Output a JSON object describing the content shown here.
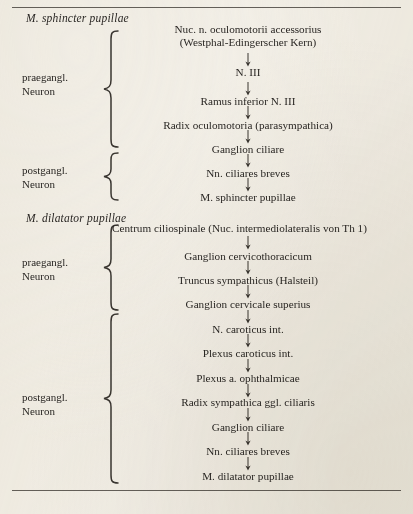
{
  "page": {
    "background_color": "#f3f0e9",
    "text_color": "#2a2724",
    "rule_color": "#4a4641"
  },
  "sections": [
    {
      "id": "sphincter",
      "title": "M. sphincter pupillae",
      "groups": [
        {
          "label_line1": "praegangl.",
          "label_line2": "Neuron",
          "nodes": [
            "Nuc. n. oculomotorii accessorius",
            "(Westphal-Edingerscher Kern)",
            "N. III",
            "Ramus inferior N. III",
            "Radix oculomotoria (parasympathica)",
            "Ganglion ciliare"
          ]
        },
        {
          "label_line1": "postgangl.",
          "label_line2": "Neuron",
          "nodes": [
            "Nn. ciliares breves",
            "M. sphincter pupillae"
          ]
        }
      ]
    },
    {
      "id": "dilatator",
      "title": "M. dilatator pupillae",
      "groups": [
        {
          "label_line1": "praegangl.",
          "label_line2": "Neuron",
          "nodes": [
            "Centrum ciliospinale (Nuc. intermediolateralis von Th 1)",
            "Ganglion cervicothoracicum",
            "Truncus sympathicus (Halsteil)",
            "Ganglion cervicale superius"
          ]
        },
        {
          "label_line1": "postgangl.",
          "label_line2": "Neuron",
          "nodes": [
            "N. caroticus int.",
            "Plexus caroticus int.",
            "Plexus a. ophthalmicae",
            "Radix sympathica ggl. ciliaris",
            "Ganglion ciliare",
            "Nn. ciliares breves",
            "M. dilatator pupillae"
          ]
        }
      ]
    }
  ],
  "flow": {
    "arrow_glyph": "down-arrow",
    "chain_sphincter": [
      {
        "text": "Nuc. n. oculomotorii accessorius",
        "line2": "(Westphal-Edingerscher Kern)"
      },
      {
        "text": "N. III"
      },
      {
        "text": "Ramus inferior N. III"
      },
      {
        "text": "Radix oculomotoria (parasympathica)"
      },
      {
        "text": "Ganglion ciliare"
      },
      {
        "text": "Nn. ciliares breves"
      },
      {
        "text": "M. sphincter pupillae"
      }
    ],
    "chain_dilatator": [
      {
        "text": "Centrum ciliospinale (Nuc. intermediolateralis von Th 1)"
      },
      {
        "text": "Ganglion cervicothoracicum"
      },
      {
        "text": "Truncus sympathicus (Halsteil)"
      },
      {
        "text": "Ganglion cervicale superius"
      },
      {
        "text": "N. caroticus int."
      },
      {
        "text": "Plexus caroticus int."
      },
      {
        "text": "Plexus a. ophthalmicae"
      },
      {
        "text": "Radix sympathica ggl. ciliaris"
      },
      {
        "text": "Ganglion ciliare"
      },
      {
        "text": "Nn. ciliares breves"
      },
      {
        "text": "M. dilatator pupillae"
      }
    ]
  },
  "labels": {
    "praegangl_1": {
      "l1": "praegangl.",
      "l2": "Neuron"
    },
    "postgangl_1": {
      "l1": "postgangl.",
      "l2": "Neuron"
    },
    "praegangl_2": {
      "l1": "praegangl.",
      "l2": "Neuron"
    },
    "postgangl_2": {
      "l1": "postgangl.",
      "l2": "Neuron"
    }
  }
}
